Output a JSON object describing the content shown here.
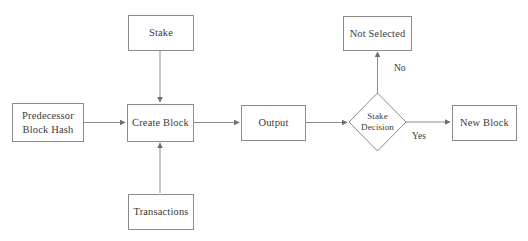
{
  "diagram": {
    "background_color": "#ffffff",
    "stroke_color": "#8c8c8c",
    "text_color": "#3a3a3a",
    "nodes": {
      "predecessor": {
        "line1": "Predecessor",
        "line2": "Block Hash",
        "shape": "rectangle"
      },
      "stake": {
        "label": "Stake",
        "shape": "rectangle"
      },
      "transactions": {
        "label": "Transactions",
        "shape": "rectangle"
      },
      "create_block": {
        "label": "Create Block",
        "shape": "rectangle"
      },
      "output": {
        "label": "Output",
        "shape": "rectangle"
      },
      "stake_decision": {
        "line1": "Stake",
        "line2": "Decision",
        "shape": "diamond"
      },
      "not_selected": {
        "label": "Not Selected",
        "shape": "rectangle"
      },
      "new_block": {
        "label": "New Block",
        "shape": "rectangle"
      }
    },
    "edge_labels": {
      "no": "No",
      "yes": "Yes"
    }
  }
}
